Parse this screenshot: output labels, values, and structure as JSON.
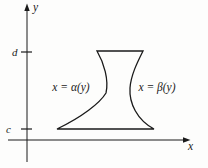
{
  "figure": {
    "type": "math-diagram",
    "colors": {
      "background": "#fdfdfc",
      "line": "#1a1a1a"
    },
    "axes": {
      "x_axis_label": "x",
      "y_axis_label": "y"
    },
    "ticks": {
      "upper_label": "d",
      "lower_label": "c"
    },
    "curves": {
      "left_label": "x = α(y)",
      "right_label": "x = β(y)"
    },
    "region": {
      "top_boundary": "y = d",
      "bottom_boundary": "y = c",
      "left_boundary": "x = α(y)",
      "right_boundary": "x = β(y)"
    }
  }
}
